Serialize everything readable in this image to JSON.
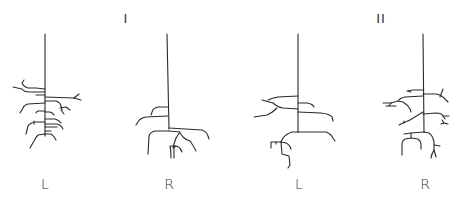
{
  "figure": {
    "groups": [
      {
        "label": "I",
        "x": 126,
        "y": 12
      },
      {
        "label": "II",
        "x": 381,
        "y": 12
      }
    ],
    "plants": [
      {
        "id": "I-L",
        "label": "L",
        "x": 45,
        "group": "I"
      },
      {
        "id": "I-R",
        "label": "R",
        "x": 169,
        "group": "I"
      },
      {
        "id": "II-L",
        "label": "L",
        "x": 299,
        "group": "II"
      },
      {
        "id": "II-R",
        "label": "R",
        "x": 425,
        "group": "II"
      }
    ],
    "stroke_color": "#2a2a2a"
  }
}
